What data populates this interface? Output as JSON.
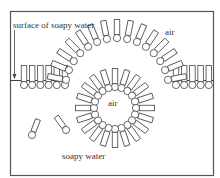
{
  "diagram": {
    "labels": {
      "surface": "surface of soapy water",
      "air_top": "air",
      "air_bubble": "air",
      "water": "soapy water"
    },
    "colors": {
      "stroke": "#444444",
      "frame": "#555555",
      "background": "#ffffff"
    },
    "elements": [
      "surface monolayer left",
      "surface monolayer right",
      "hemispherical film arching into air",
      "spherical air bubble in water with tails outward",
      "two free soap molecules in water"
    ]
  }
}
